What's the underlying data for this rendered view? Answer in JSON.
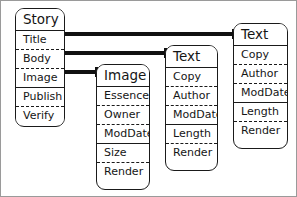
{
  "diagram": {
    "background_color": "#ffffff",
    "line_color": "#111111",
    "border_color": "#1a1a1a"
  },
  "entities": [
    {
      "id": "story",
      "name": "Story",
      "rows": [
        {
          "label": "Title",
          "separator": "solid"
        },
        {
          "label": "Body",
          "separator": "dashed"
        },
        {
          "label": "Image",
          "separator": "dashed"
        },
        {
          "label": "Publish",
          "separator": "solid"
        },
        {
          "label": "Verify",
          "separator": "dashed"
        }
      ]
    },
    {
      "id": "image",
      "name": "Image",
      "rows": [
        {
          "label": "Essence",
          "separator": "solid"
        },
        {
          "label": "Owner",
          "separator": "dashed"
        },
        {
          "label": "ModDate",
          "separator": "dashed"
        },
        {
          "label": "Size",
          "separator": "solid"
        },
        {
          "label": "Render",
          "separator": "dashed"
        }
      ]
    },
    {
      "id": "text-middle",
      "name": "Text",
      "rows": [
        {
          "label": "Copy",
          "separator": "solid"
        },
        {
          "label": "Author",
          "separator": "dashed"
        },
        {
          "label": "ModDate",
          "separator": "dashed"
        },
        {
          "label": "Length",
          "separator": "solid"
        },
        {
          "label": "Render",
          "separator": "dashed"
        }
      ]
    },
    {
      "id": "text-top",
      "name": "Text",
      "rows": [
        {
          "label": "Copy",
          "separator": "solid"
        },
        {
          "label": "Author",
          "separator": "dashed"
        },
        {
          "label": "ModDate",
          "separator": "dashed"
        },
        {
          "label": "Length",
          "separator": "solid"
        },
        {
          "label": "Render",
          "separator": "dashed"
        }
      ]
    }
  ],
  "connections": [
    {
      "id": "title-to-text-top",
      "from": "story.Title",
      "to": "text-top.Text"
    },
    {
      "id": "body-to-text-middle",
      "from": "story.Body",
      "to": "text-middle.Text"
    },
    {
      "id": "image-to-image-box",
      "from": "story.Image",
      "to": "image.Image"
    }
  ]
}
